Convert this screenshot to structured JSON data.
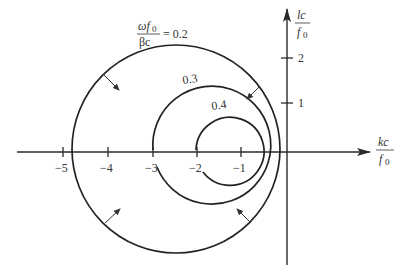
{
  "figure": {
    "type": "Nyquist-style locus diagram",
    "x_axis": {
      "label_numerator": "kc",
      "label_denominator": "f",
      "label_denominator_sub": "0",
      "ticks": [
        "−5",
        "−4",
        "−3",
        "−2",
        "−1"
      ]
    },
    "y_axis": {
      "label_numerator": "lc",
      "label_denominator": "f",
      "label_denominator_sub": "0",
      "ticks": [
        "1",
        "2"
      ]
    },
    "curves": [
      {
        "label_prefix_numerator": "ωf",
        "label_prefix_numerator_sub": "0",
        "label_prefix_denominator": "βc",
        "label_equals": "= 0.2",
        "value": "0.2"
      },
      {
        "label": "0.3",
        "value": "0.3"
      },
      {
        "label": "0.4",
        "value": "0.4"
      }
    ]
  },
  "colors": {
    "line": "#222222",
    "background": "#ffffff"
  }
}
